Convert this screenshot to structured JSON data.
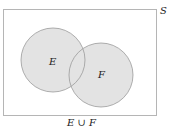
{
  "diagram": {
    "type": "venn",
    "universe_label": "S",
    "sets": [
      {
        "label": "E",
        "cx": 53,
        "cy": 60,
        "r": 32
      },
      {
        "label": "F",
        "cx": 101,
        "cy": 75,
        "r": 32
      }
    ],
    "caption": "E ∪ F",
    "fill_color": "#e3e3e3",
    "stroke_color": "#9a9a9a",
    "border_color": "#b5b5b5"
  }
}
